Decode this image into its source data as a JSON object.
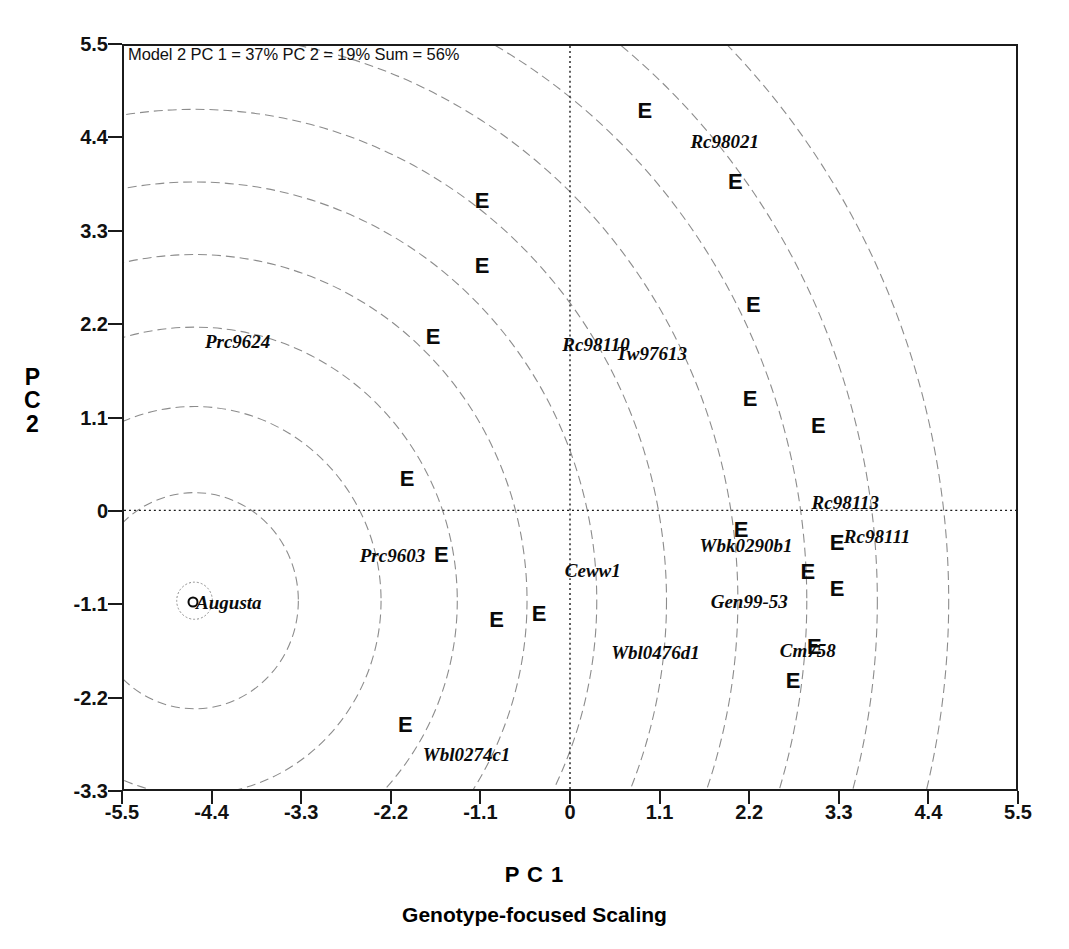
{
  "chart_data": {
    "type": "scatter",
    "title": "Model 2 PC 1 = 37% PC 2 = 19% Sum = 56%",
    "xlabel": "P C 1",
    "ylabel_lines": [
      "P",
      "C",
      "2"
    ],
    "caption": "Genotype-focused Scaling",
    "xlim": [
      -5.5,
      5.5
    ],
    "ylim": [
      -3.3,
      5.5
    ],
    "grid": false,
    "zero_lines": true,
    "legend": "none",
    "xticks": [
      "-5.5",
      "-4.4",
      "-3.3",
      "-2.2",
      "-1.1",
      "0",
      "1.1",
      "2.2",
      "3.3",
      "4.4",
      "5.5"
    ],
    "xtick_values": [
      -5.5,
      -4.4,
      -3.3,
      -2.2,
      -1.1,
      0,
      1.1,
      2.2,
      3.3,
      4.4,
      5.5
    ],
    "yticks": [
      "5.5",
      "4.4",
      "3.3",
      "2.2",
      "1.1",
      "0",
      "-1.1",
      "-2.2",
      "-3.3"
    ],
    "ytick_values": [
      5.5,
      4.4,
      3.3,
      2.2,
      1.1,
      0,
      -1.1,
      -2.2,
      -3.3
    ],
    "series": [
      {
        "name": "Environments",
        "marker": "E",
        "points": [
          {
            "label": "E",
            "x": 0.92,
            "y": 4.71
          },
          {
            "label": "E",
            "x": 2.03,
            "y": 3.88
          },
          {
            "label": "E",
            "x": -1.08,
            "y": 3.65
          },
          {
            "label": "E",
            "x": -1.08,
            "y": 2.88
          },
          {
            "label": "E",
            "x": 2.25,
            "y": 2.42
          },
          {
            "label": "E",
            "x": -1.68,
            "y": 2.05
          },
          {
            "label": "E",
            "x": 2.21,
            "y": 1.32
          },
          {
            "label": "E",
            "x": 3.05,
            "y": 1.0
          },
          {
            "label": "E",
            "x": -2.0,
            "y": 0.38
          },
          {
            "label": "E",
            "x": 2.1,
            "y": -0.22
          },
          {
            "label": "E",
            "x": 3.28,
            "y": -0.38
          },
          {
            "label": "E",
            "x": -1.58,
            "y": -0.52
          },
          {
            "label": "E",
            "x": 2.92,
            "y": -0.72
          },
          {
            "label": "E",
            "x": 3.28,
            "y": -0.92
          },
          {
            "label": "E",
            "x": -0.9,
            "y": -1.28
          },
          {
            "label": "E",
            "x": -0.38,
            "y": -1.22
          },
          {
            "label": "E",
            "x": 3.0,
            "y": -1.6
          },
          {
            "label": "E",
            "x": 2.74,
            "y": -2.0
          },
          {
            "label": "E",
            "x": -2.02,
            "y": -2.52
          }
        ]
      },
      {
        "name": "Genotypes",
        "marker": "open-circle",
        "points": [
          {
            "label": "Augusta",
            "x": -4.63,
            "y": -1.07,
            "marker": true,
            "label_dx": 36
          },
          {
            "label": "Prc9624",
            "x": -4.08,
            "y": 2.0,
            "marker": false
          },
          {
            "label": "Prc9603",
            "x": -2.18,
            "y": -0.52,
            "marker": false
          },
          {
            "label": "Ceww1",
            "x": 0.28,
            "y": -0.7,
            "marker": false
          },
          {
            "label": "Rc98021",
            "x": 1.9,
            "y": 4.36,
            "marker": false
          },
          {
            "label": "Rc98110",
            "x": 0.32,
            "y": 1.97,
            "marker": false
          },
          {
            "label": "Tw97613",
            "x": 1.0,
            "y": 1.86,
            "marker": false
          },
          {
            "label": "Rc98113",
            "x": 3.38,
            "y": 0.1,
            "marker": false
          },
          {
            "label": "Rc98111",
            "x": 3.77,
            "y": -0.3,
            "marker": false
          },
          {
            "label": "Wbk0290b1",
            "x": 2.16,
            "y": -0.4,
            "marker": false
          },
          {
            "label": "Gen99-53",
            "x": 2.2,
            "y": -1.06,
            "marker": false
          },
          {
            "label": "Wbl0476d1",
            "x": 1.05,
            "y": -1.66,
            "marker": false
          },
          {
            "label": "Cm758",
            "x": 2.92,
            "y": -1.64,
            "marker": false
          },
          {
            "label": "Wbl0274c1",
            "x": -1.27,
            "y": -2.86,
            "marker": false
          }
        ]
      }
    ],
    "contours": {
      "description": "concentric dashed contour rings centered on Augusta",
      "center_x": -4.63,
      "center_y": -1.07,
      "radii": [
        0.22,
        1.28,
        2.3,
        3.24,
        4.1,
        4.96,
        5.82,
        6.7,
        7.55,
        8.42,
        9.3
      ],
      "style": "dashed",
      "color": "#8c8c8c"
    }
  }
}
